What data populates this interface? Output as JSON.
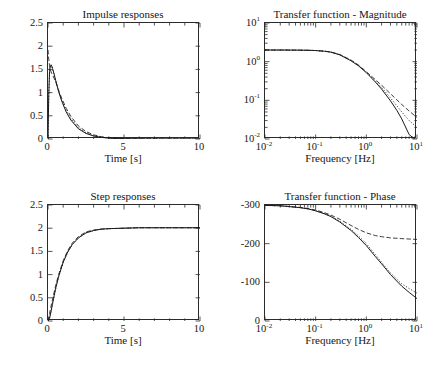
{
  "figure": {
    "title": "",
    "background": "#ffffff",
    "ink": "#1b1b1b"
  },
  "chart_data": [
    {
      "type": "line",
      "panel": "top-left",
      "title": "Impulse responses",
      "xlabel": "Time [s]",
      "ylabel": "",
      "xlim": [
        0,
        10
      ],
      "ylim": [
        0,
        2.5
      ],
      "xticks": [
        "0",
        "5",
        "10"
      ],
      "yticks": [
        "0",
        "0.5",
        "1",
        "1.5",
        "2",
        "2.5"
      ],
      "grid": false,
      "legend": "none",
      "x": [
        0,
        0.05,
        0.1,
        0.15,
        0.2,
        0.25,
        0.3,
        0.4,
        0.5,
        0.7,
        0.9,
        1.2,
        1.5,
        2.0,
        2.5,
        3.0,
        3.5,
        4.0,
        4.5,
        5.0,
        6.0,
        7.0,
        8.0,
        9.0,
        10.0
      ],
      "series": [
        {
          "name": "model-1",
          "style": "solid",
          "values": [
            0.0,
            0.95,
            1.45,
            1.58,
            1.6,
            1.57,
            1.52,
            1.4,
            1.27,
            1.02,
            0.82,
            0.58,
            0.41,
            0.22,
            0.12,
            0.065,
            0.035,
            0.019,
            0.01,
            0.006,
            0.002,
            0.001,
            0.0,
            0.0,
            0.0
          ]
        },
        {
          "name": "model-2",
          "style": "dashed",
          "values": [
            1.92,
            1.72,
            1.58,
            1.5,
            1.45,
            1.41,
            1.38,
            1.31,
            1.24,
            1.05,
            0.88,
            0.66,
            0.49,
            0.28,
            0.16,
            0.09,
            0.05,
            0.027,
            0.015,
            0.008,
            0.003,
            0.001,
            0.0,
            0.0,
            0.0
          ]
        },
        {
          "name": "model-3",
          "style": "dashdot",
          "values": [
            0.0,
            0.9,
            1.4,
            1.55,
            1.58,
            1.56,
            1.51,
            1.39,
            1.26,
            1.03,
            0.84,
            0.61,
            0.44,
            0.24,
            0.135,
            0.075,
            0.04,
            0.022,
            0.012,
            0.007,
            0.002,
            0.001,
            0.0,
            0.0,
            0.0
          ]
        }
      ]
    },
    {
      "type": "line",
      "panel": "top-right",
      "title": "Transfer function - Magnitude",
      "xlabel": "Frequency [Hz]",
      "ylabel": "",
      "xscale": "log",
      "yscale": "log",
      "xlim": [
        0.01,
        10
      ],
      "ylim": [
        0.01,
        10
      ],
      "xticks": [
        "10-2",
        "10-1",
        "100",
        "101"
      ],
      "yticks": [
        "10-2",
        "10-1",
        "100",
        "101"
      ],
      "grid": false,
      "legend": "none",
      "x": [
        0.01,
        0.02,
        0.04,
        0.07,
        0.1,
        0.15,
        0.2,
        0.3,
        0.5,
        0.7,
        1.0,
        1.5,
        2.0,
        3.0,
        4.0,
        5.0,
        7.0,
        10.0
      ],
      "series": [
        {
          "name": "model-1",
          "style": "solid",
          "values": [
            2.0,
            2.0,
            1.99,
            1.97,
            1.94,
            1.86,
            1.76,
            1.5,
            1.05,
            0.78,
            0.52,
            0.3,
            0.195,
            0.097,
            0.055,
            0.033,
            0.013,
            0.003
          ]
        },
        {
          "name": "model-2",
          "style": "dashed",
          "values": [
            2.0,
            2.0,
            1.99,
            1.97,
            1.94,
            1.87,
            1.78,
            1.53,
            1.1,
            0.82,
            0.55,
            0.345,
            0.245,
            0.148,
            0.103,
            0.078,
            0.053,
            0.036
          ]
        },
        {
          "name": "model-3",
          "style": "dashdot",
          "values": [
            2.0,
            2.0,
            1.99,
            1.97,
            1.94,
            1.86,
            1.77,
            1.51,
            1.07,
            0.8,
            0.53,
            0.32,
            0.215,
            0.115,
            0.072,
            0.05,
            0.03,
            0.02
          ]
        }
      ]
    },
    {
      "type": "line",
      "panel": "bottom-left",
      "title": "Step responses",
      "xlabel": "Time [s]",
      "ylabel": "",
      "xlim": [
        0,
        10
      ],
      "ylim": [
        0,
        2.5
      ],
      "xticks": [
        "0",
        "5",
        "10"
      ],
      "yticks": [
        "0",
        "0.5",
        "1",
        "1.5",
        "2",
        "2.5"
      ],
      "grid": false,
      "legend": "none",
      "x": [
        0,
        0.1,
        0.2,
        0.3,
        0.5,
        0.7,
        1.0,
        1.3,
        1.6,
        2.0,
        2.5,
        3.0,
        3.5,
        4.0,
        5.0,
        6.0,
        7.0,
        8.0,
        9.0,
        10.0
      ],
      "series": [
        {
          "name": "model-1",
          "style": "solid",
          "values": [
            0.0,
            0.06,
            0.21,
            0.38,
            0.7,
            0.96,
            1.27,
            1.49,
            1.65,
            1.79,
            1.9,
            1.95,
            1.98,
            1.99,
            2.0,
            2.01,
            2.01,
            2.01,
            2.01,
            2.01
          ]
        },
        {
          "name": "model-2",
          "style": "dashed",
          "values": [
            0.0,
            0.16,
            0.32,
            0.47,
            0.76,
            1.0,
            1.3,
            1.52,
            1.68,
            1.82,
            1.92,
            1.96,
            1.98,
            1.99,
            2.0,
            2.01,
            2.01,
            2.01,
            2.01,
            2.01
          ]
        },
        {
          "name": "model-3",
          "style": "dashdot",
          "values": [
            0.0,
            0.05,
            0.19,
            0.36,
            0.68,
            0.95,
            1.26,
            1.48,
            1.65,
            1.79,
            1.9,
            1.95,
            1.98,
            1.99,
            2.0,
            2.01,
            2.01,
            2.01,
            2.01,
            2.01
          ]
        }
      ]
    },
    {
      "type": "line",
      "panel": "bottom-right",
      "title": "Transfer function - Phase",
      "xlabel": "Frequency [Hz]",
      "ylabel": "",
      "xscale": "log",
      "xlim": [
        0.01,
        10
      ],
      "ylim": [
        -300,
        0
      ],
      "xticks": [
        "10-2",
        "10-1",
        "100",
        "101"
      ],
      "yticks": [
        "0",
        "-100",
        "-200",
        "-300"
      ],
      "grid": false,
      "legend": "none",
      "x": [
        0.01,
        0.02,
        0.03,
        0.05,
        0.07,
        0.1,
        0.15,
        0.2,
        0.3,
        0.5,
        0.7,
        1.0,
        1.5,
        2.0,
        3.0,
        5.0,
        7.0,
        10.0
      ],
      "series": [
        {
          "name": "model-1",
          "style": "solid",
          "values": [
            -1,
            -2,
            -4,
            -7,
            -10,
            -15,
            -23,
            -30,
            -44,
            -66,
            -84,
            -105,
            -133,
            -152,
            -180,
            -210,
            -226,
            -242
          ]
        },
        {
          "name": "model-2",
          "style": "dashed",
          "values": [
            -1,
            -2,
            -4,
            -6,
            -9,
            -13,
            -20,
            -26,
            -37,
            -53,
            -63,
            -72,
            -79,
            -82,
            -85,
            -87,
            -88,
            -89
          ]
        },
        {
          "name": "model-3",
          "style": "dashdot",
          "values": [
            -1,
            -2,
            -4,
            -7,
            -10,
            -15,
            -22,
            -29,
            -42,
            -63,
            -80,
            -100,
            -128,
            -148,
            -176,
            -204,
            -216,
            -228
          ]
        }
      ]
    }
  ]
}
